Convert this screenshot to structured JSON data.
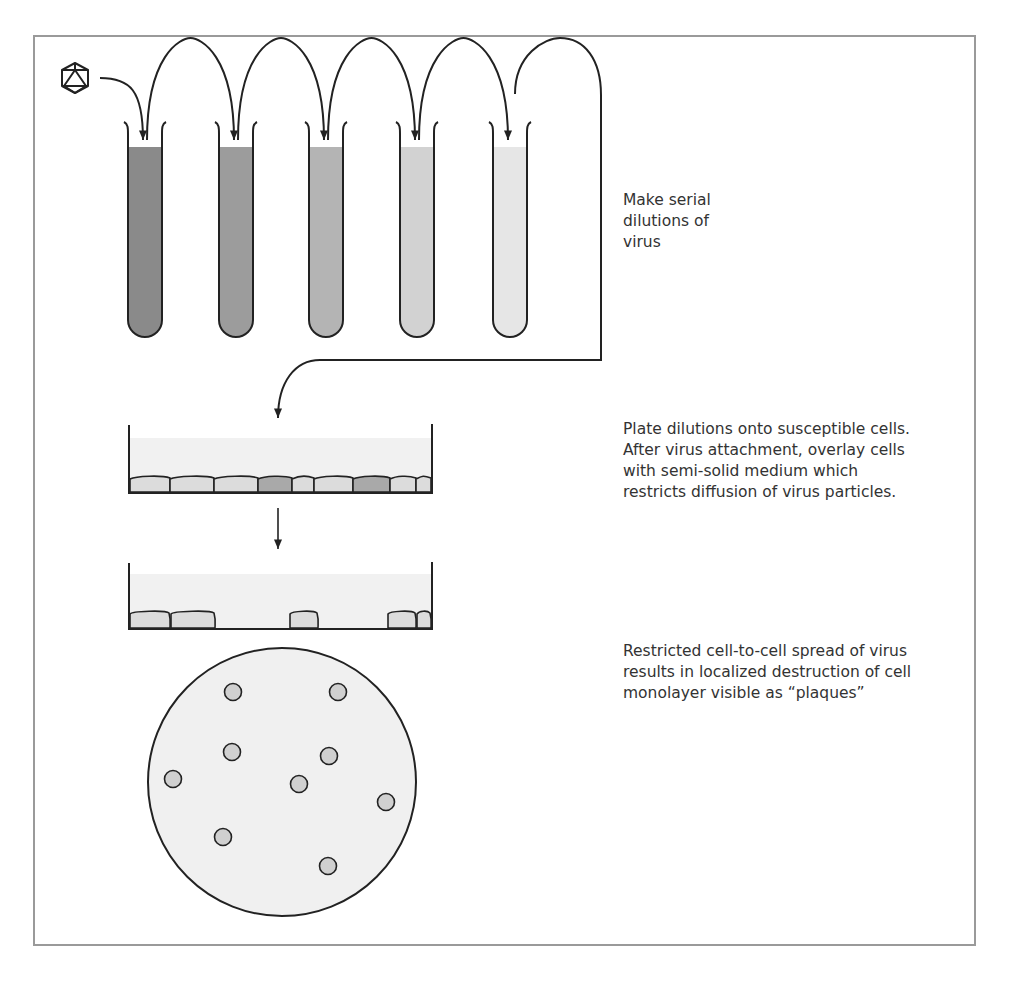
{
  "figure": {
    "steps": [
      {
        "id": "serial-dilution",
        "caption": "Make serial\ndilutions of\nvirus"
      },
      {
        "id": "plate-and-overlay",
        "caption": "Plate dilutions onto susceptible cells.\nAfter virus attachment, overlay cells\nwith semi-solid medium which\nrestricts diffusion of virus particles."
      },
      {
        "id": "plaque-formation",
        "caption": "Restricted cell-to-cell spread of virus\nresults in localized destruction of cell\nmonolayer visible as “plaques”"
      }
    ],
    "icons": {
      "virus": "icosahedron-virus-icon"
    },
    "tubes": {
      "count": 5,
      "fill_colors": [
        "#8a8a8a",
        "#9c9c9c",
        "#b4b4b4",
        "#d2d2d2",
        "#e6e6e6"
      ]
    },
    "dish_before": {
      "cells": [
        {
          "infected": false
        },
        {
          "infected": false
        },
        {
          "infected": false
        },
        {
          "infected": true
        },
        {
          "infected": false
        },
        {
          "infected": false
        },
        {
          "infected": true
        },
        {
          "infected": false
        },
        {
          "infected": false
        }
      ]
    },
    "dish_after": {
      "remaining_cells": 5
    },
    "plate": {
      "plaque_count": 9
    },
    "colors": {
      "line": "#222222",
      "frame": "#9a9a9a",
      "medium": "#f1f1f1",
      "cell": "#dcdcdc",
      "infected_cell": "#a9a9a9",
      "plaque": "#d0d0d0"
    }
  }
}
